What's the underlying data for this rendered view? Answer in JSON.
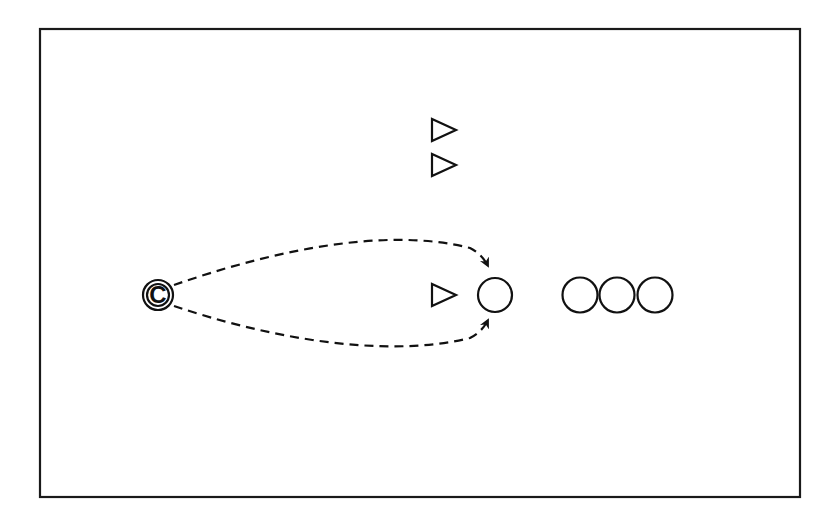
{
  "diagram": {
    "type": "drill-diagram",
    "colors": {
      "stroke": "#111111",
      "background": "#ffffff"
    },
    "field": {
      "x": 40,
      "y": 29,
      "width": 760,
      "height": 468
    },
    "coach": {
      "label": "C",
      "cx": 158,
      "cy": 295
    },
    "cones": [
      {
        "cx": 443,
        "cy": 130
      },
      {
        "cx": 443,
        "cy": 165
      },
      {
        "cx": 443,
        "cy": 295
      }
    ],
    "players": [
      {
        "cx": 495,
        "cy": 295,
        "role": "receiver"
      },
      {
        "cx": 580,
        "cy": 295,
        "role": "queue"
      },
      {
        "cx": 617,
        "cy": 295,
        "role": "queue"
      },
      {
        "cx": 655,
        "cy": 295,
        "role": "queue"
      }
    ],
    "passes": [
      {
        "style": "dashed",
        "direction": "coach-to-player",
        "curve": "upper"
      },
      {
        "style": "dashed",
        "direction": "coach-to-player",
        "curve": "lower"
      }
    ]
  }
}
